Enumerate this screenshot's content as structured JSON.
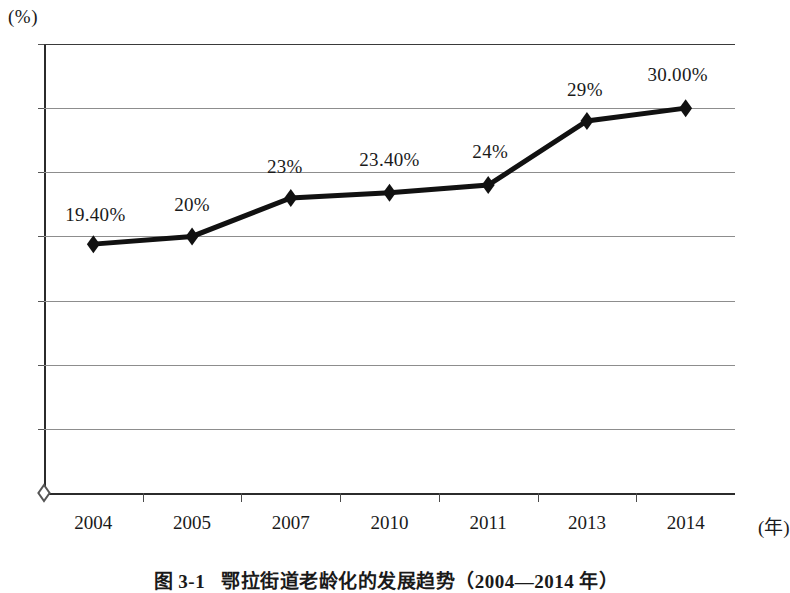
{
  "chart_data": {
    "type": "line",
    "xlabel": "(年)",
    "ylabel": "(%)",
    "ylim": [
      0,
      35
    ],
    "ytick_step": 5,
    "grid": true,
    "legend": "none",
    "categories": [
      "2004",
      "2005",
      "2007",
      "2010",
      "2011",
      "2013",
      "2014"
    ],
    "values": [
      19.4,
      20.0,
      23.0,
      23.4,
      24.0,
      29.0,
      30.0
    ],
    "point_labels": [
      "19.40%",
      "20%",
      "23%",
      "23.40%",
      "24%",
      "29%",
      "30.00%"
    ],
    "ytick_labels": [
      "0",
      "5",
      "10",
      "15",
      "20",
      "25",
      "30",
      "35"
    ],
    "ytick_values": [
      0,
      5,
      10,
      15,
      20,
      25,
      30,
      35
    ],
    "origin_marker": {
      "label": "origin-open-diamond",
      "value": 0,
      "style": "hollow"
    },
    "marker_style": "filled-diamond",
    "line_color": "#111111",
    "grid_color": "#8d8d8d",
    "axis_color": "#2b2b2b"
  },
  "axes": {
    "y_unit": "(%)",
    "x_unit": "(年)"
  },
  "caption": {
    "number": "图 3-1",
    "text": "鄂拉街道老龄化的发展趋势（2004—2014 年）"
  }
}
